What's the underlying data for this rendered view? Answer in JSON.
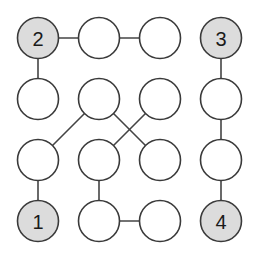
{
  "puzzle": {
    "type": "numberlink-graph",
    "grid": {
      "rows": 4,
      "cols": 4
    },
    "colors": {
      "given_fill": "#dcdcdc",
      "empty_fill": "#ffffff",
      "stroke": "#3a3a3a"
    },
    "nodes": [
      {
        "row": 0,
        "col": 0,
        "label": "2",
        "given": true
      },
      {
        "row": 0,
        "col": 1,
        "label": "",
        "given": false
      },
      {
        "row": 0,
        "col": 2,
        "label": "",
        "given": false
      },
      {
        "row": 0,
        "col": 3,
        "label": "3",
        "given": true
      },
      {
        "row": 1,
        "col": 0,
        "label": "",
        "given": false
      },
      {
        "row": 1,
        "col": 1,
        "label": "",
        "given": false
      },
      {
        "row": 1,
        "col": 2,
        "label": "",
        "given": false
      },
      {
        "row": 1,
        "col": 3,
        "label": "",
        "given": false
      },
      {
        "row": 2,
        "col": 0,
        "label": "",
        "given": false
      },
      {
        "row": 2,
        "col": 1,
        "label": "",
        "given": false
      },
      {
        "row": 2,
        "col": 2,
        "label": "",
        "given": false
      },
      {
        "row": 2,
        "col": 3,
        "label": "",
        "given": false
      },
      {
        "row": 3,
        "col": 0,
        "label": "1",
        "given": true
      },
      {
        "row": 3,
        "col": 1,
        "label": "",
        "given": false
      },
      {
        "row": 3,
        "col": 2,
        "label": "",
        "given": false
      },
      {
        "row": 3,
        "col": 3,
        "label": "4",
        "given": true
      }
    ],
    "edges": [
      [
        [
          0,
          0
        ],
        [
          0,
          1
        ]
      ],
      [
        [
          0,
          1
        ],
        [
          0,
          2
        ]
      ],
      [
        [
          0,
          0
        ],
        [
          1,
          0
        ]
      ],
      [
        [
          0,
          3
        ],
        [
          1,
          3
        ]
      ],
      [
        [
          1,
          3
        ],
        [
          2,
          3
        ]
      ],
      [
        [
          2,
          3
        ],
        [
          3,
          3
        ]
      ],
      [
        [
          1,
          1
        ],
        [
          2,
          0
        ]
      ],
      [
        [
          1,
          1
        ],
        [
          2,
          2
        ]
      ],
      [
        [
          1,
          2
        ],
        [
          2,
          1
        ]
      ],
      [
        [
          2,
          0
        ],
        [
          3,
          0
        ]
      ],
      [
        [
          2,
          1
        ],
        [
          3,
          1
        ]
      ],
      [
        [
          3,
          1
        ],
        [
          3,
          2
        ]
      ]
    ]
  }
}
